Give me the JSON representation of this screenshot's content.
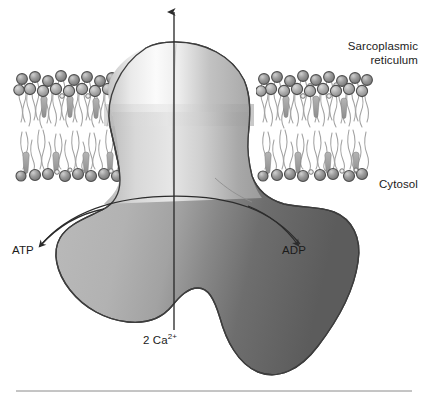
{
  "figure": {
    "background_color": "#ffffff",
    "bottom_rule_color": "#8a8a8a"
  },
  "labels": {
    "sarcoplasmic_reticulum_line1": "Sarcoplasmic",
    "sarcoplasmic_reticulum_line2": "reticulum",
    "cytosol": "Cytosol",
    "atp": "ATP",
    "adp": "ADP",
    "calcium_count": "2 Ca",
    "calcium_charge": "2+"
  },
  "colors": {
    "outline": "#3d3d3d",
    "protein_light": "#f2f2f2",
    "protein_mid": "#b4b4b4",
    "protein_dark": "#5e5e5e",
    "lipid_head_fill": "#9a9a9a",
    "lipid_head_edge": "#4e4e4e",
    "lipid_tail": "#9d9d9d",
    "text": "#1b1b1b"
  },
  "membrane": {
    "region_label": "phospholipid-bilayer",
    "top_y": 72,
    "bottom_y": 180,
    "left_segment": {
      "x_start": 16,
      "x_end": 122
    },
    "right_segment": {
      "x_start": 258,
      "x_end": 372
    },
    "outer_leaflet_head_count": 46,
    "inner_leaflet_head_count": 26
  },
  "protein": {
    "name": "calcium-atpase-pump",
    "lumenal_dome_top_y": 42,
    "transmembrane_waist_x": 175,
    "cytosolic_domain_bottom_y": 375
  },
  "arrows": {
    "calcium_transport": {
      "name": "calcium-transport-arrow",
      "direction": "upward",
      "x": 174,
      "from_y": 330,
      "to_y": 10
    },
    "atp_binding": {
      "name": "atp-arrow",
      "direction": "toward-atp-label"
    },
    "adp_release": {
      "name": "adp-arrow",
      "direction": "toward-adp-label"
    }
  }
}
